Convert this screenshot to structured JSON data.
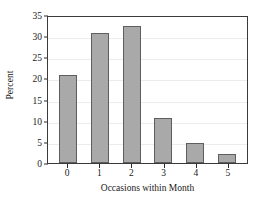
{
  "chart_data": {
    "type": "bar",
    "title": "",
    "subtitle": "",
    "xlabel": "Occasions within Month",
    "ylabel": "Percent",
    "categories": [
      "0",
      "1",
      "2",
      "3",
      "4",
      "5"
    ],
    "values": [
      20.9,
      30.8,
      32.4,
      10.7,
      4.8,
      2.1
    ],
    "series": [
      {
        "name": "Percent",
        "values": [
          20.9,
          30.8,
          32.4,
          10.7,
          4.8,
          2.1
        ]
      }
    ],
    "ylim": [
      0,
      35
    ],
    "xlim": [
      -0.5,
      5.5
    ],
    "yticks": [
      0,
      5,
      10,
      15,
      20,
      25,
      30,
      35
    ],
    "ytick_labels": [
      "0",
      "5",
      "10",
      "15",
      "20",
      "25",
      "30",
      "35"
    ],
    "xtick_labels": [
      "0",
      "1",
      "2",
      "3",
      "4",
      "5"
    ],
    "grid": "horizontal",
    "legend": "none",
    "annotations": [],
    "colors": {
      "bar_fill": "#a9a9a9",
      "bar_border": "#5e5e5e",
      "gridline": "#ececec",
      "axis": "#3a3a3a",
      "background": "#ffffff",
      "text": "#1a1a1a"
    }
  }
}
